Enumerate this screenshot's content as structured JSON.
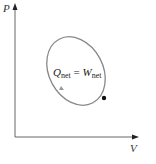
{
  "diagram": {
    "y_axis_label": "P",
    "x_axis_label": "V",
    "equation": {
      "q": "Q",
      "q_sub": "net",
      "eq": " = ",
      "w": "W",
      "w_sub": "net"
    },
    "colors": {
      "axis": "#555555",
      "cycle": "#888888",
      "point": "#111111"
    }
  }
}
